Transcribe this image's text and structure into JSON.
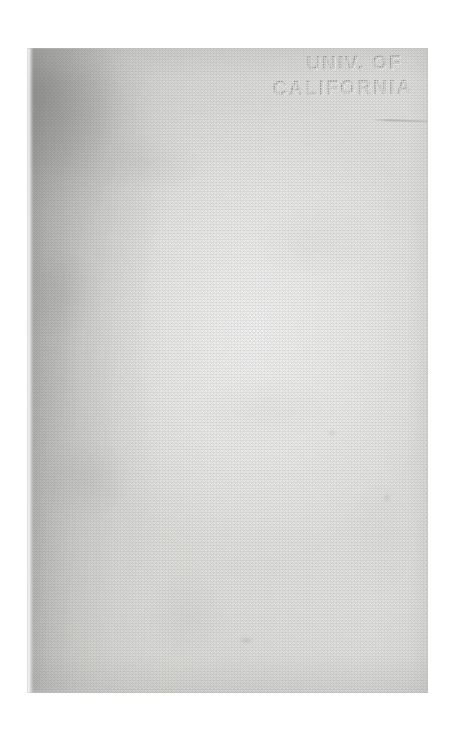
{
  "document": {
    "kind": "scanned-book-endpaper",
    "page_label": "blank flyleaf"
  },
  "stamp": {
    "name": "library-ownership-stamp",
    "style": "embossed perforated dots",
    "line_1": "UNIV. OF",
    "line_2": "CALIFORNIA",
    "full_text": "UNIV. OF CALIFORNIA",
    "position": "top-right"
  },
  "marks": {
    "pencil_stroke": "faint ruled stroke below stamp",
    "smudges": [
      "faint smudge lower-centre",
      "faint smudge mid-right",
      "faint speck mid-right"
    ]
  },
  "colors": {
    "scan_bed": "#ffffff",
    "paper_light": "#eaeae8",
    "paper_mid": "#dcdcda",
    "paper_shadow": "#c3c3c1",
    "stamp_ink": "#767674"
  },
  "page_geometry": {
    "left": "27px",
    "top": "48px",
    "width": "401px",
    "height": "645px"
  }
}
